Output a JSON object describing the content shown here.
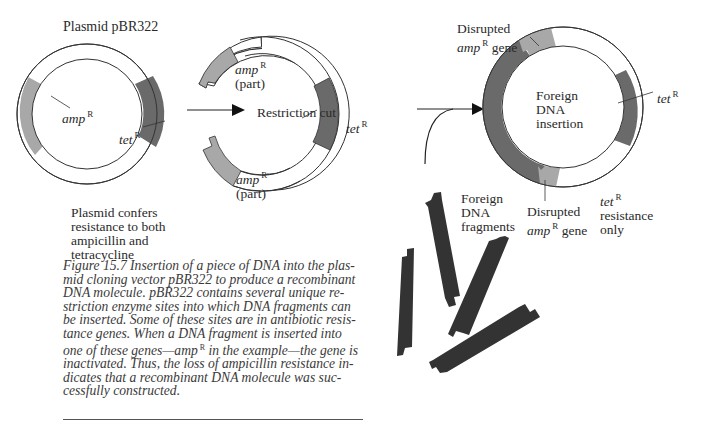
{
  "figure": {
    "title": "Plasmid pBR322",
    "left_plasmid": {
      "amp_label": "amp",
      "tet_label": "tet",
      "superscript": "R",
      "description": [
        "Plasmid confers",
        "resistance to both",
        "ampicillin and",
        "tetracycline"
      ]
    },
    "middle_plasmid": {
      "center_label": "Restriction cut",
      "amp_top_label": "amp",
      "amp_top_part": "(part)",
      "amp_bottom_label": "amp",
      "amp_bottom_part": "(part)",
      "tet_label": "tet",
      "superscript": "R"
    },
    "right_plasmid": {
      "center_label": [
        "Foreign",
        "DNA",
        "insertion"
      ],
      "disrupted_top": [
        "Disrupted",
        "amp",
        "gene"
      ],
      "disrupted_bottom": [
        "Disrupted",
        "amp",
        "gene"
      ],
      "tet_label": "tet",
      "resistance_note": [
        "tet",
        "resistance",
        "only"
      ],
      "superscript": "R"
    },
    "fragments_label": [
      "Foreign",
      "DNA",
      "fragments"
    ],
    "colors": {
      "amp_gray": "#a8a8a8",
      "tet_dark": "#6a6a6a",
      "fragment_dark": "#333333",
      "line": "#333333"
    }
  },
  "caption": {
    "lines": [
      "Figure 15.7  Insertion of a piece of DNA into the plas-",
      "mid cloning vector pBR322 to produce a recombinant",
      "DNA molecule. pBR322 contains several unique re-",
      "striction enzyme sites into which DNA fragments can",
      "be inserted. Some of these sites are in antibiotic resis-",
      "tance genes. When a DNA fragment is inserted into",
      "one of these genes—amp",
      " in the example—the gene is",
      "inactivated. Thus, the loss of ampicillin resistance in-",
      "dicates that a recombinant DNA molecule was suc-",
      "cessfully constructed."
    ],
    "superscript": "R"
  }
}
